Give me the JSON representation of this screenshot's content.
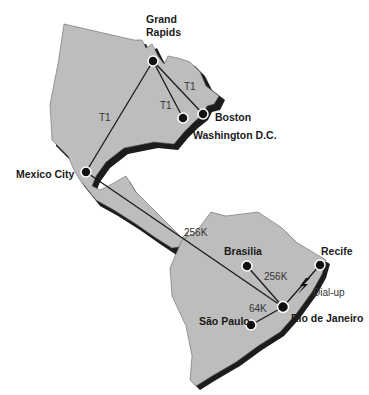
{
  "diagram": {
    "title": "",
    "colors": {
      "land": "#bdbdbd",
      "shadow": "#1c1c1c",
      "line": "#1a1a1a",
      "node": "#111111"
    },
    "cities": [
      {
        "id": "grand-rapids",
        "label_line1": "Grand",
        "label_line2": "Rapids",
        "x": 153,
        "y": 61
      },
      {
        "id": "boston",
        "label": "Boston",
        "x": 203,
        "y": 114
      },
      {
        "id": "washington",
        "label": "Washington D.C.",
        "x": 183,
        "y": 118
      },
      {
        "id": "mexico-city",
        "label": "Mexico City",
        "x": 86,
        "y": 172
      },
      {
        "id": "brasilia",
        "label": "Brasilia",
        "x": 247,
        "y": 266
      },
      {
        "id": "recife",
        "label": "Recife",
        "x": 320,
        "y": 265
      },
      {
        "id": "rio",
        "label": "Rio de Janeiro",
        "x": 283,
        "y": 307
      },
      {
        "id": "sao-paulo",
        "label": "São Paulo",
        "x": 251,
        "y": 325
      }
    ],
    "links": [
      {
        "from": "grand-rapids",
        "to": "mexico-city",
        "label": "T1"
      },
      {
        "from": "grand-rapids",
        "to": "washington",
        "label": "T1"
      },
      {
        "from": "grand-rapids",
        "to": "boston",
        "label": "T1"
      },
      {
        "from": "mexico-city",
        "to": "rio",
        "label": "256K"
      },
      {
        "from": "brasilia",
        "to": "rio",
        "label": "256K"
      },
      {
        "from": "sao-paulo",
        "to": "rio",
        "label": "64K"
      },
      {
        "from": "recife",
        "to": "rio",
        "label": "Dial-up"
      }
    ]
  }
}
